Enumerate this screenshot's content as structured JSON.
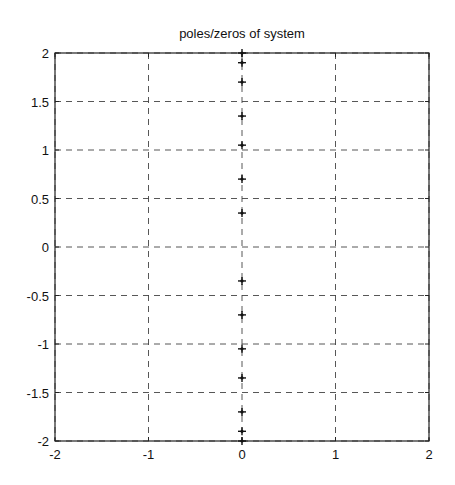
{
  "chart_data": {
    "type": "scatter",
    "title": "poles/zeros of system",
    "xlabel": "",
    "ylabel": "",
    "xlim": [
      -2,
      2
    ],
    "ylim": [
      -2,
      2
    ],
    "grid": true,
    "grid_style": "dashed",
    "marker": "+",
    "xticks": [
      -2,
      -1,
      0,
      1,
      2
    ],
    "yticks": [
      -2,
      -1.5,
      -1,
      -0.5,
      0,
      0.5,
      1,
      1.5,
      2
    ],
    "xtick_labels": [
      "-2",
      "-1",
      "0",
      "1",
      "2"
    ],
    "ytick_labels": [
      "-2",
      "-1.5",
      "-1",
      "-0.5",
      "0",
      "0.5",
      "1",
      "1.5",
      "2"
    ],
    "series": [
      {
        "name": "poles/zeros",
        "x": [
          0,
          0,
          0,
          0,
          0,
          0,
          0,
          0,
          0,
          0,
          0,
          0,
          0,
          0
        ],
        "y": [
          2.0,
          1.9,
          1.7,
          1.35,
          1.05,
          0.7,
          0.35,
          -0.35,
          -0.7,
          -1.05,
          -1.35,
          -1.7,
          -1.9,
          -2.0
        ]
      }
    ]
  },
  "colors": {
    "axes": "#222222",
    "grid": "#444444",
    "marker": "#111111",
    "background": "#ffffff"
  }
}
